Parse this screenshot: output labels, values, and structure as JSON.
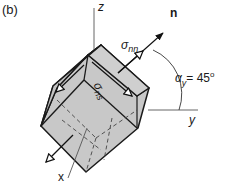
{
  "figure": {
    "panel_label": "(b)",
    "axes": {
      "z": "z",
      "y": "y",
      "x": "x"
    },
    "normal_label": "n",
    "normal_stress": {
      "symbol": "σ",
      "subscript": "nn"
    },
    "shear_stress": {
      "symbol": "σ",
      "subscript": "ns"
    },
    "angle": {
      "symbol": "α",
      "subscript": "y",
      "equals": "= 45",
      "unit": "o"
    },
    "colors": {
      "cube_fill": "#c8c8c8",
      "cube_top": "#d2d2d2",
      "stroke": "#1a1a1a",
      "axis": "#555555",
      "background": "#ffffff"
    }
  }
}
